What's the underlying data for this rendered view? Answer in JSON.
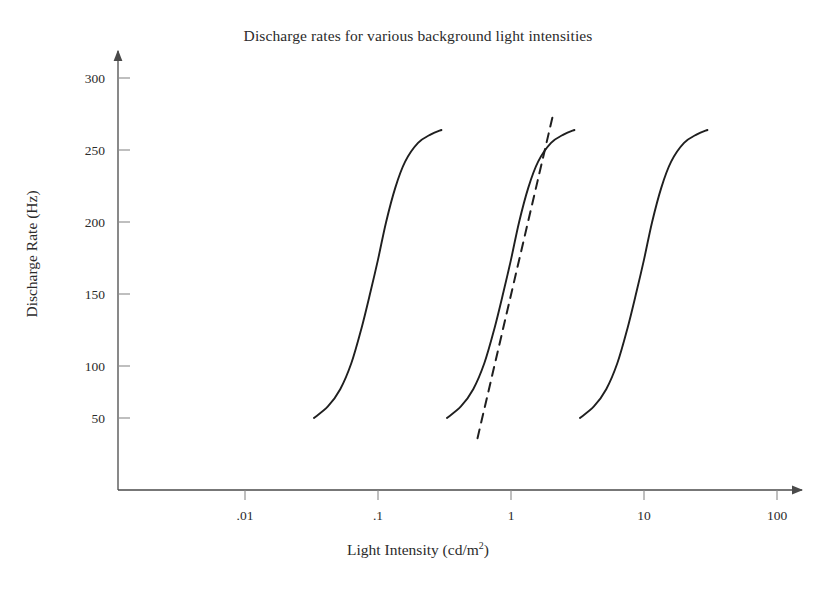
{
  "chart_data": {
    "type": "line",
    "title": "Discharge rates for various background light intensities",
    "xlabel_text": "Light Intensity (cd/m",
    "xlabel_sup": "2",
    "xlabel_tail": ")",
    "xlabel": "Light Intensity (cd/m2)",
    "ylabel": "Discharge Rate (Hz)",
    "xscale": "log",
    "yscale": "linear",
    "xlim": [
      0.0032,
      180
    ],
    "ylim": [
      0,
      320
    ],
    "grid": false,
    "legend": false,
    "legend_position": "none",
    "line_color": "#1f1f1f",
    "axis_color": "#4a4a4a",
    "background_color": "#ffffff",
    "xticks": [
      {
        "label": ".01",
        "value": 0.01
      },
      {
        "label": ".1",
        "value": 0.1
      },
      {
        "label": "1",
        "value": 1
      },
      {
        "label": "10",
        "value": 10
      },
      {
        "label": "100",
        "value": 100
      }
    ],
    "yticks": [
      {
        "label": "50",
        "value": 50
      },
      {
        "label": "100",
        "value": 100
      },
      {
        "label": "150",
        "value": 150
      },
      {
        "label": "200",
        "value": 200
      },
      {
        "label": "250",
        "value": 250
      },
      {
        "label": "300",
        "value": 300
      }
    ],
    "series": [
      {
        "name": "curve-1",
        "style": "solid",
        "midpoint_x": 0.1,
        "x": [
          0.033,
          0.042,
          0.052,
          0.063,
          0.075,
          0.088,
          0.1,
          0.115,
          0.135,
          0.16,
          0.2,
          0.25,
          0.3
        ],
        "y": [
          50,
          58,
          70,
          88,
          112,
          138,
          160,
          186,
          210,
          228,
          241,
          247,
          250
        ]
      },
      {
        "name": "curve-2",
        "style": "solid",
        "midpoint_x": 1.0,
        "x": [
          0.33,
          0.42,
          0.52,
          0.63,
          0.75,
          0.88,
          1.0,
          1.15,
          1.35,
          1.6,
          2.0,
          2.5,
          3.0
        ],
        "y": [
          50,
          58,
          70,
          88,
          112,
          138,
          160,
          186,
          210,
          228,
          241,
          247,
          250
        ]
      },
      {
        "name": "curve-3",
        "style": "solid",
        "midpoint_x": 10.0,
        "x": [
          3.3,
          4.2,
          5.2,
          6.3,
          7.5,
          8.8,
          10.0,
          11.5,
          13.5,
          16.0,
          20.0,
          25.0,
          30.0
        ],
        "y": [
          50,
          58,
          70,
          88,
          112,
          138,
          160,
          186,
          210,
          228,
          241,
          247,
          250
        ]
      },
      {
        "name": "tangent-line",
        "style": "dashed",
        "description": "dashed tangent to curve-2 at its steepest point",
        "x": [
          0.56,
          2.1
        ],
        "y": [
          36,
          263
        ]
      }
    ]
  }
}
